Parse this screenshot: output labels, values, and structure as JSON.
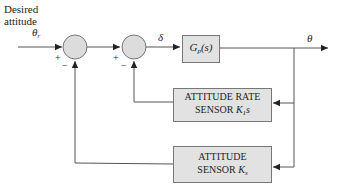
{
  "diagram": {
    "type": "block-diagram",
    "colors": {
      "line": "#555555",
      "block_fill": "#e2e2e2",
      "block_border": "#777777",
      "junction_fill": "#dcdcdc"
    },
    "input": {
      "label_line1": "Desired",
      "label_line2": "attitude",
      "symbol": "θ",
      "symbol_sub": "r"
    },
    "junctions": [
      {
        "id": "sum1",
        "plus_sign": "+",
        "minus_sign": "−"
      },
      {
        "id": "sum2",
        "plus_sign": "+",
        "minus_sign": "−"
      }
    ],
    "signals": {
      "error": "δ",
      "output": "θ"
    },
    "blocks": {
      "plant": {
        "label": "G",
        "label_sub": "p",
        "label_tail": "(s)"
      },
      "rate_sensor": {
        "line1": "ATTITUDE RATE",
        "line2": "SENSOR ",
        "gain": "K",
        "gain_sub": "1",
        "gain_tail": "s"
      },
      "attitude_sensor": {
        "line1": "ATTITUDE",
        "line2": "SENSOR ",
        "gain": "K",
        "gain_sub": "s"
      }
    }
  }
}
